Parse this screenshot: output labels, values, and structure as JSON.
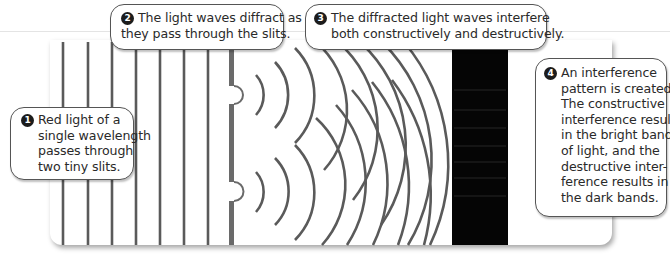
{
  "figure": {
    "colors": {
      "wave_line": "#5a5a5a",
      "barrier": "#6a6a6a",
      "dark_band": "#050505",
      "callout_border": "#555555",
      "number_badge": "#1c1c1c"
    },
    "plane_wave_x": [
      63,
      88,
      112,
      136,
      160,
      184,
      208
    ],
    "barrier_x": 231,
    "slit_y": [
      95,
      192
    ],
    "screen": {
      "x": 452,
      "width": 56,
      "label": "interference pattern screen"
    }
  },
  "callouts": [
    {
      "number": "1",
      "lines": [
        "Red light of a",
        "single wavelength",
        "passes through",
        "two tiny slits."
      ]
    },
    {
      "number": "2",
      "lines": [
        "The light waves diffract as",
        "they pass through the slits."
      ]
    },
    {
      "number": "3",
      "lines": [
        "The diffracted light waves interfere",
        "both constructively and destructively."
      ]
    },
    {
      "number": "4",
      "lines": [
        "An interference",
        "pattern is created.",
        "The constructive",
        "interference results",
        "in the bright band",
        "of light, and the",
        "destructive inter-",
        "ference results in",
        "the dark bands."
      ]
    }
  ]
}
